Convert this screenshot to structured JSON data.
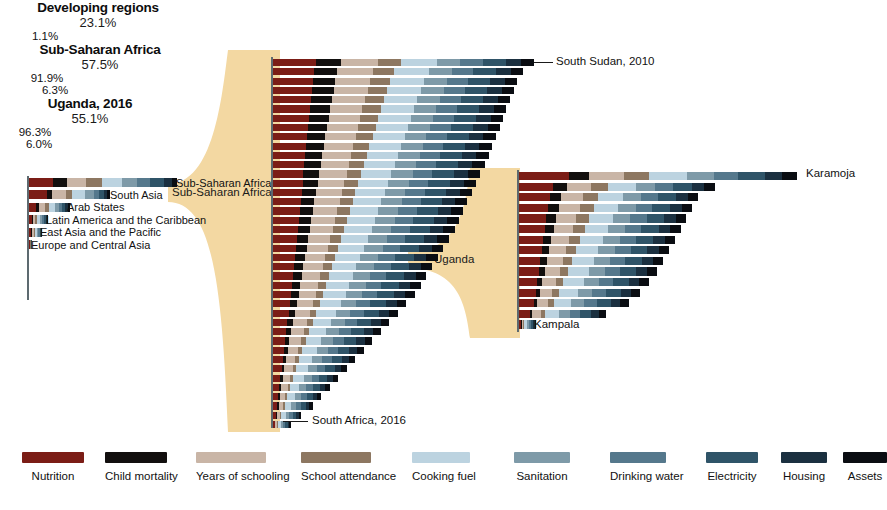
{
  "figure": {
    "type": "nested-stacked-bar-drilldown",
    "background": "#ffffff",
    "funnel_color": "#f3d8a2"
  },
  "legend": {
    "items": [
      {
        "label": "Nutrition",
        "color": "#7b1d16"
      },
      {
        "label": "Child mortality",
        "color": "#120f0e"
      },
      {
        "label": "Years of schooling",
        "color": "#c9b5a6"
      },
      {
        "label": "School attendance",
        "color": "#8d7761"
      },
      {
        "label": "Cooking fuel",
        "color": "#bcd3e0"
      },
      {
        "label": "Sanitation",
        "color": "#7e9aa8"
      },
      {
        "label": "Drinking water",
        "color": "#55788c"
      },
      {
        "label": "Electricity",
        "color": "#2f5468"
      },
      {
        "label": "Housing",
        "color": "#1b3040"
      },
      {
        "label": "Assets",
        "color": "#0a0d12"
      }
    ]
  },
  "panels": {
    "developing": {
      "title": "Developing regions",
      "pct": "23.1%",
      "annotations": [
        {
          "text": "Sub-Saharan Africa"
        },
        {
          "text": "South Asia"
        },
        {
          "text": "Arab States"
        },
        {
          "text": "Latin America and the Caribbean"
        },
        {
          "text": "East Asia and the Pacific"
        },
        {
          "text": "Europe and Central Asia"
        }
      ],
      "bottom_pct": "1.1%"
    },
    "ssa": {
      "title": "Sub-Saharan Africa",
      "pct": "57.5%",
      "top_label": "South Sudan, 2010",
      "top_pct": "91.9%",
      "bottom_label": "South Africa, 2016",
      "bottom_pct": "6.3%"
    },
    "uganda": {
      "title": "Uganda, 2016",
      "pct": "55.1%",
      "top_label": "Karamoja",
      "top_pct": "96.3%",
      "bottom_label": "Kampala",
      "bottom_pct": "6.0%"
    }
  },
  "funnels": [
    {
      "label": "Sub-Saharan Africa"
    },
    {
      "label": "Uganda"
    }
  ],
  "chart_data": {
    "type": "bar",
    "xlabel": "",
    "ylabel": "",
    "stack_order": [
      "Nutrition",
      "Child mortality",
      "Years of schooling",
      "School attendance",
      "Cooking fuel",
      "Sanitation",
      "Drinking water",
      "Electricity",
      "Housing",
      "Assets"
    ],
    "legend_position": "bottom",
    "grid": false,
    "panels": [
      {
        "name": "Developing regions",
        "total": 23.1,
        "unit": "%",
        "categories": [
          "Sub-Saharan Africa",
          "South Asia",
          "Arab States",
          "Latin America and the Caribbean",
          "East Asia and the Pacific",
          "Europe and Central Asia"
        ],
        "values": [
          57.5,
          31.4,
          16.1,
          7.5,
          5.2,
          1.1
        ],
        "series": [
          {
            "name": "Nutrition",
            "values": [
              9.5,
              7.0,
              2.9,
              1.0,
              0.9,
              0.25
            ]
          },
          {
            "name": "Child mortality",
            "values": [
              5.2,
              2.1,
              1.0,
              0.4,
              0.3,
              0.1
            ]
          },
          {
            "name": "Years of schooling",
            "values": [
              7.5,
              5.2,
              2.4,
              1.0,
              0.7,
              0.15
            ]
          },
          {
            "name": "School attendance",
            "values": [
              6.1,
              2.6,
              1.5,
              0.6,
              0.4,
              0.1
            ]
          },
          {
            "name": "Cooking fuel",
            "values": [
              7.8,
              4.9,
              2.2,
              1.2,
              0.8,
              0.15
            ]
          },
          {
            "name": "Sanitation",
            "values": [
              6.0,
              3.6,
              1.7,
              0.9,
              0.6,
              0.1
            ]
          },
          {
            "name": "Drinking water",
            "values": [
              5.0,
              2.0,
              1.3,
              0.8,
              0.5,
              0.08
            ]
          },
          {
            "name": "Electricity",
            "values": [
              5.2,
              1.8,
              1.1,
              0.6,
              0.4,
              0.07
            ]
          },
          {
            "name": "Housing",
            "values": [
              3.1,
              1.3,
              1.0,
              0.5,
              0.3,
              0.05
            ]
          },
          {
            "name": "Assets",
            "values": [
              2.1,
              0.9,
              1.0,
              0.5,
              0.3,
              0.05
            ]
          }
        ]
      },
      {
        "name": "Sub-Saharan Africa",
        "total": 57.5,
        "unit": "%",
        "note": "40 countries ranked from highest to lowest multidimensional poverty headcount",
        "top": {
          "label": "South Sudan, 2010",
          "value": 91.9
        },
        "bottom": {
          "label": "South Africa, 2016",
          "value": 6.3
        },
        "values": [
          91.9,
          88.0,
          86.0,
          85.0,
          83.5,
          82.0,
          81.0,
          80.0,
          78.5,
          77.0,
          76.0,
          74.5,
          73.0,
          71.5,
          70.0,
          68.5,
          67.0,
          65.5,
          64.0,
          62.0,
          60.0,
          58.0,
          56.0,
          54.0,
          52.0,
          50.0,
          47.0,
          44.0,
          41.0,
          38.0,
          35.0,
          32.0,
          29.0,
          26.0,
          23.0,
          20.0,
          17.0,
          14.0,
          10.0,
          6.3
        ]
      },
      {
        "name": "Uganda, 2016",
        "total": 55.1,
        "unit": "%",
        "note": "15 subnational regions ranked from highest to lowest",
        "top": {
          "label": "Karamoja",
          "value": 96.3
        },
        "bottom": {
          "label": "Kampala",
          "value": 6.0
        },
        "categories": [
          "Karamoja",
          "",
          "",
          "",
          "",
          "",
          "",
          "",
          "",
          "",
          "",
          "",
          "",
          "",
          "Kampala"
        ],
        "values": [
          96.3,
          68.0,
          62.0,
          60.0,
          58.0,
          56.0,
          54.0,
          52.0,
          50.0,
          48.0,
          45.0,
          42.0,
          38.0,
          30.0,
          6.0
        ]
      }
    ]
  }
}
